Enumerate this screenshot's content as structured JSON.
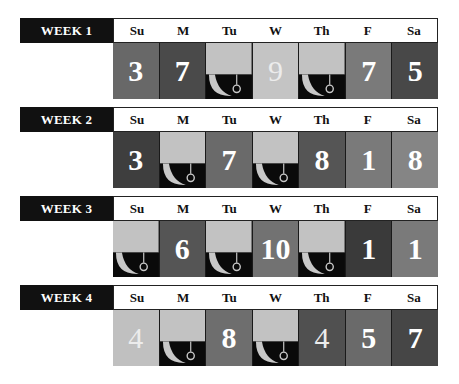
{
  "day_headers": [
    "Su",
    "M",
    "Tu",
    "W",
    "Th",
    "F",
    "Sa"
  ],
  "icon_cell": {
    "icon": "hook-moon-icon",
    "top_color": "#c2c2c2",
    "bottom_color": "#0a0a0a",
    "glyph_color": "#c8c8c8"
  },
  "weeks": [
    {
      "label": "WEEK 1",
      "top": 18,
      "cells": [
        {
          "value": "3",
          "bg": "#686868"
        },
        {
          "value": "7",
          "bg": "#4a4a4a"
        },
        {
          "icon": true
        },
        {
          "value": "9",
          "bg": "#c4c4c4",
          "light": true
        },
        {
          "icon": true
        },
        {
          "value": "7",
          "bg": "#7a7a7a"
        },
        {
          "value": "5",
          "bg": "#484848"
        }
      ]
    },
    {
      "label": "WEEK 2",
      "top": 107,
      "cells": [
        {
          "value": "3",
          "bg": "#3e3e3e"
        },
        {
          "icon": true
        },
        {
          "value": "7",
          "bg": "#6a6a6a"
        },
        {
          "icon": true
        },
        {
          "value": "8",
          "bg": "#555555"
        },
        {
          "value": "1",
          "bg": "#7a7a7a"
        },
        {
          "value": "8",
          "bg": "#858585"
        }
      ]
    },
    {
      "label": "WEEK 3",
      "top": 196,
      "cells": [
        {
          "icon": true
        },
        {
          "value": "6",
          "bg": "#555555"
        },
        {
          "icon": true
        },
        {
          "value": "10",
          "bg": "#727272"
        },
        {
          "icon": true
        },
        {
          "value": "1",
          "bg": "#3a3a3a"
        },
        {
          "value": "1",
          "bg": "#7a7a7a"
        }
      ]
    },
    {
      "label": "WEEK 4",
      "top": 285,
      "cells": [
        {
          "value": "4",
          "bg": "#c0c0c0",
          "light": true
        },
        {
          "icon": true
        },
        {
          "value": "8",
          "bg": "#6e6e6e"
        },
        {
          "icon": true
        },
        {
          "value": "4",
          "bg": "#505050",
          "light": true
        },
        {
          "value": "5",
          "bg": "#6a6a6a"
        },
        {
          "value": "7",
          "bg": "#464646"
        }
      ]
    }
  ]
}
